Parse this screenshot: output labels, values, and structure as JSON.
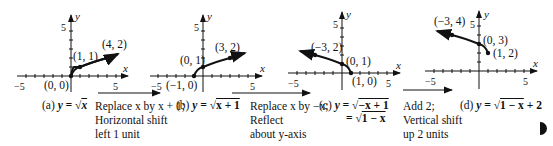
{
  "panels": [
    {
      "id": "a",
      "caption_prefix": "(a)",
      "equation": "y = √x",
      "eq_lhs": "y = ",
      "eq_rad": "x",
      "eq_tail": "",
      "points": [
        {
          "label": "(0, 0)",
          "x": 0,
          "y": 0
        },
        {
          "label": "(1, 1)",
          "x": 1,
          "y": 1
        },
        {
          "label": "(4, 2)",
          "x": 4,
          "y": 2
        }
      ]
    },
    {
      "id": "b",
      "caption_prefix": "(b)",
      "equation": "y = √(x + 1)",
      "eq_lhs": "y = ",
      "eq_rad": "x + 1",
      "eq_tail": "",
      "points": [
        {
          "label": "(−1, 0)",
          "x": -1,
          "y": 0
        },
        {
          "label": "(0, 1)",
          "x": 0,
          "y": 1
        },
        {
          "label": "(3, 2)",
          "x": 3,
          "y": 2
        }
      ]
    },
    {
      "id": "c",
      "caption_prefix": "(c)",
      "equation": "y = √(−x + 1) = √(1 − x)",
      "eq_lhs": "y = ",
      "eq_rad": "−x + 1",
      "eq_tail": "",
      "eq_line2_prefix": "= ",
      "eq_line2_rad": "1 − x",
      "points": [
        {
          "label": "(−3, 2)",
          "x": -3,
          "y": 2
        },
        {
          "label": "(0, 1)",
          "x": 0,
          "y": 1
        },
        {
          "label": "(1, 0)",
          "x": 1,
          "y": 0
        }
      ]
    },
    {
      "id": "d",
      "caption_prefix": "(d)",
      "equation": "y = √(1 − x) + 2",
      "eq_lhs": "y = ",
      "eq_rad": "1 − x",
      "eq_tail": " + 2",
      "points": [
        {
          "label": "(−3, 4)",
          "x": -3,
          "y": 4
        },
        {
          "label": "(0, 3)",
          "x": 0,
          "y": 3
        },
        {
          "label": "(1, 2)",
          "x": 1,
          "y": 2
        }
      ]
    }
  ],
  "axes": {
    "x_label": "x",
    "y_label": "y",
    "tick_neg5": "−5",
    "tick_5": "5"
  },
  "transformations": [
    {
      "lines": [
        "Replace x by x + 1;",
        "Horizontal shift",
        "left 1 unit"
      ]
    },
    {
      "lines": [
        "Replace x by −x;",
        "Reflect",
        "about y-axis"
      ]
    },
    {
      "lines": [
        "Add 2;",
        "Vertical shift",
        "up 2 units"
      ]
    }
  ]
}
